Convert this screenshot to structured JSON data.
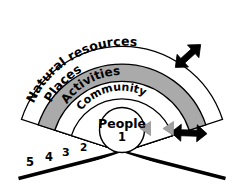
{
  "figure": {
    "type": "concentric-fan-diagram",
    "background_color": "#ffffff",
    "stroke_color": "#000000",
    "shaded_band_color": "#aaaaaa",
    "arrow_color": "#000000",
    "inner_arrow_color": "#a0a0a0"
  },
  "rings": [
    {
      "number": "1",
      "label": "People",
      "shaded": false,
      "shape": "circle",
      "label_position": "center"
    },
    {
      "number": "2",
      "label": "Community",
      "shaded": false,
      "shape": "arc",
      "label_position": "curved"
    },
    {
      "number": "3",
      "label": "Activities",
      "shaded": false,
      "shape": "arc",
      "label_position": "curved"
    },
    {
      "number": "4",
      "label": "Places",
      "shaded": true,
      "shape": "arc",
      "label_position": "curved"
    },
    {
      "number": "5",
      "label": "Natural resources",
      "shaded": false,
      "shape": "arc",
      "label_position": "curved"
    }
  ],
  "arrows": [
    {
      "name": "upper-right-double-arrow",
      "color": "#000000",
      "style": "double-headed",
      "location": "outer-upper-right"
    },
    {
      "name": "lower-right-double-arrow",
      "color": "#000000",
      "style": "double-headed",
      "location": "outer-lower-right"
    },
    {
      "name": "inner-feed-arrow-outer",
      "color": "#a0a0a0",
      "style": "single-headed",
      "location": "toward-center"
    },
    {
      "name": "inner-feed-arrow-inner",
      "color": "#a0a0a0",
      "style": "single-headed",
      "location": "toward-center"
    }
  ],
  "baseline": {
    "name": "v-baseline",
    "color": "#000000",
    "description": "thick black diagonal lines forming a V from the center outward"
  }
}
